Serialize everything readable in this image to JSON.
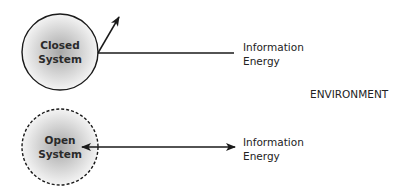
{
  "closed_system": {
    "label_line1": "Closed",
    "label_line2": "System",
    "border": "solid",
    "flows": {
      "line1": "Information",
      "line2": "Energy"
    }
  },
  "open_system": {
    "label_line1": "Open",
    "label_line2": "System",
    "border": "dashed",
    "flows": {
      "line1": "Information",
      "line2": "Energy"
    }
  },
  "environment_label": "ENVIRONMENT",
  "colors": {
    "stroke": "#1a1a1a",
    "circle_fill_center": "#a8a8a8",
    "circle_fill_edge": "#f4f4f4",
    "text": "#222222"
  }
}
